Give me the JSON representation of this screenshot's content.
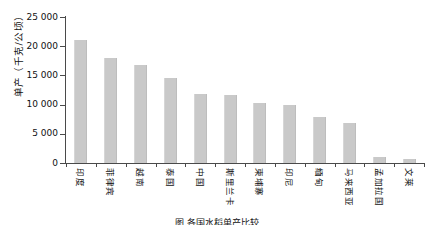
{
  "chart_data": {
    "type": "bar",
    "title": "",
    "xlabel": "",
    "ylabel": "单产（千克/公顷）",
    "ylim": [
      0,
      25000
    ],
    "yticks": [
      0,
      5000,
      10000,
      15000,
      20000,
      25000
    ],
    "ytick_labels": [
      "0",
      "5 000",
      "10 000",
      "15 000",
      "20 000",
      "25 000"
    ],
    "grid": false,
    "legend": "none",
    "bar_color": "#c9c9c9",
    "axis_color": "#4a4a4a",
    "categories": [
      "印度",
      "菲律宾",
      "越南",
      "泰国",
      "中国",
      "斯里兰卡",
      "柬埔寨",
      "印尼",
      "缅甸",
      "马来西亚",
      "孟加拉国",
      "文莱"
    ],
    "values": [
      21000,
      18000,
      16700,
      14600,
      11900,
      11600,
      10300,
      9900,
      7800,
      6900,
      1100,
      700
    ]
  },
  "caption": {
    "text": "图  各国水稻单产比较"
  }
}
